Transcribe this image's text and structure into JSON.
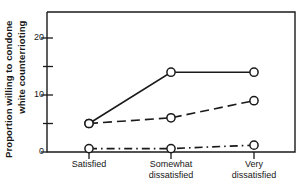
{
  "chart_data": {
    "type": "line",
    "title": "",
    "xlabel": "",
    "ylabel": "Proportion willing to condone white counterrioting",
    "ylabel_lines": [
      "Proportion willing to condone",
      "white counterrioting"
    ],
    "categories": [
      "Satisfied",
      "Somewhat dissatisfied",
      "Very dissatisfied"
    ],
    "category_lines": [
      [
        "Satisfied"
      ],
      [
        "Somewhat",
        "dissatisfied"
      ],
      [
        "Very",
        "dissatisfied"
      ]
    ],
    "ylim": [
      0,
      25
    ],
    "ytick_values": [
      0,
      10,
      20
    ],
    "ytick_labels": [
      "0",
      "10",
      "20"
    ],
    "yminor_tick_values": [
      5,
      15
    ],
    "grid": false,
    "legend_position": "none",
    "series": [
      {
        "name": "solid",
        "style": "solid",
        "marker": "open-circle",
        "color": "#1a1a1a",
        "values": [
          5,
          14,
          14
        ]
      },
      {
        "name": "dashed",
        "style": "dashed",
        "marker": "open-circle",
        "color": "#1a1a1a",
        "values": [
          5,
          6,
          9
        ]
      },
      {
        "name": "dash-dot",
        "style": "dash-dot",
        "marker": "open-circle",
        "color": "#1a1a1a",
        "values": [
          0.6,
          0.6,
          1.2
        ]
      }
    ]
  },
  "axes": {
    "frame_color": "#1a1a1a",
    "tick_color": "#1a1a1a"
  }
}
